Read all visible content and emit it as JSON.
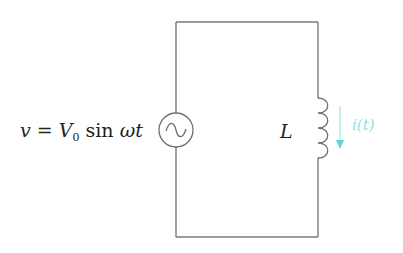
{
  "diagram": {
    "type": "circuit",
    "source": {
      "symbol": "ac-voltage-source",
      "label_parts": {
        "v": "v",
        "eq": " = ",
        "V": "V",
        "sub": "0",
        "sin": " sin ",
        "omega": "ω",
        "t": "t"
      },
      "label_full": "v = V0 sin ωt"
    },
    "inductor": {
      "symbol": "inductor-coil",
      "label": "L",
      "turns": 4
    },
    "current": {
      "label": "i(t)",
      "direction": "down",
      "color": "#5fd3d8"
    },
    "colors": {
      "wire": "#7a7a7a",
      "text": "#222222",
      "current": "#5fd3d8",
      "background": "#ffffff"
    }
  }
}
